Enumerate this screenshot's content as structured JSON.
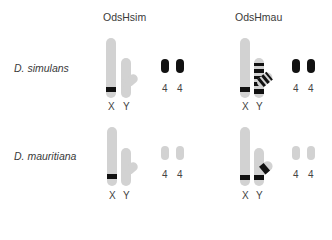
{
  "columns": [
    {
      "title": "OdsHsim"
    },
    {
      "title": "OdsHmau"
    }
  ],
  "rows": [
    {
      "species": "D. simulans"
    },
    {
      "species": "D. mauritiana"
    }
  ],
  "labels": {
    "x": "X",
    "y": "Y",
    "dot": "4"
  },
  "colors": {
    "chromosome": "#d2d2d2",
    "band": "#111111",
    "text": "#3a3a3a"
  },
  "panels": [
    {
      "row": "D. simulans",
      "column": "OdsHsim",
      "x_band": true,
      "y_bands": "none",
      "dot_chromosomes": "black"
    },
    {
      "row": "D. simulans",
      "column": "OdsHmau",
      "x_band": true,
      "y_bands": "heavily banded",
      "dot_chromosomes": "black"
    },
    {
      "row": "D. mauritiana",
      "column": "OdsHsim",
      "x_band": true,
      "y_bands": "none",
      "dot_chromosomes": "grey"
    },
    {
      "row": "D. mauritiana",
      "column": "OdsHmau",
      "x_band": true,
      "y_bands": "base band + branch band",
      "dot_chromosomes": "grey"
    }
  ]
}
